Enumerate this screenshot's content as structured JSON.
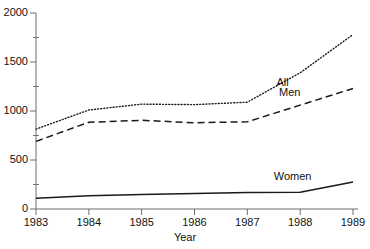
{
  "chart_data": {
    "type": "line",
    "title": "",
    "subtitle": "",
    "xlabel": "Year",
    "ylabel": "",
    "x": [
      1983,
      1984,
      1985,
      1986,
      1987,
      1988,
      1989
    ],
    "xtick_labels": [
      "1983",
      "1984",
      "1985",
      "1986",
      "1987",
      "1988",
      "1989"
    ],
    "ytick_labels": [
      "0",
      "500",
      "1000",
      "1500",
      "2000"
    ],
    "ytick_values": [
      0,
      500,
      1000,
      1500,
      2000
    ],
    "yminor_values": [
      250,
      750,
      1250,
      1750
    ],
    "xlim": [
      1983,
      1989
    ],
    "ylim": [
      0,
      2000
    ],
    "grid": false,
    "legend_position": "inline-right",
    "series": [
      {
        "name": "All",
        "style": "dotted",
        "color": "#1a1a1a",
        "values": [
          815,
          1010,
          1070,
          1065,
          1090,
          1390,
          1780
        ],
        "label_x": 1987.55,
        "label_y": 1290
      },
      {
        "name": "Men",
        "style": "dashed",
        "color": "#1a1a1a",
        "values": [
          690,
          885,
          905,
          880,
          890,
          1060,
          1230
        ],
        "label_x": 1987.6,
        "label_y": 1185
      },
      {
        "name": "Women",
        "style": "solid",
        "color": "#1a1a1a",
        "values": [
          110,
          135,
          148,
          158,
          168,
          172,
          275
        ],
        "label_x": 1987.5,
        "label_y": 330
      }
    ]
  },
  "axis": {
    "x_title": "Year"
  }
}
